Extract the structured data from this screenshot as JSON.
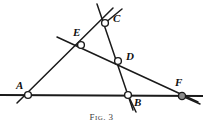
{
  "figure": {
    "caption_lead": "F",
    "caption_small": "IG",
    "caption_sep": ". ",
    "caption_number": "3",
    "caption_full": "FIG. 3",
    "background_color": "#ffffff",
    "ink_color": "#1a1a1a",
    "marker_fill_color": "#ffffff",
    "marker_special_fill_color": "#8a8a8a"
  },
  "points": [
    {
      "id": "A",
      "label": "A",
      "x": 28,
      "y": 95,
      "label_x": 16,
      "label_y": 80,
      "marker": "open-circle"
    },
    {
      "id": "B",
      "label": "B",
      "x": 128,
      "y": 95,
      "label_x": 134,
      "label_y": 98,
      "marker": "open-circle"
    },
    {
      "id": "C",
      "label": "C",
      "x": 105,
      "y": 23,
      "label_x": 113,
      "label_y": 14,
      "marker": "open-circle"
    },
    {
      "id": "D",
      "label": "D",
      "x": 118,
      "y": 61,
      "label_x": 126,
      "label_y": 52,
      "marker": "open-circle"
    },
    {
      "id": "E",
      "label": "E",
      "x": 81,
      "y": 45,
      "label_x": 74,
      "label_y": 28,
      "marker": "open-circle"
    },
    {
      "id": "F",
      "label": "F",
      "x": 182,
      "y": 96,
      "label_x": 176,
      "label_y": 78,
      "marker": "filled-circle"
    }
  ],
  "lines": [
    {
      "id": "baseline-ABF",
      "name": "horizontal-base-line",
      "x1": 0,
      "y1": 95,
      "x2": 203,
      "y2": 96
    },
    {
      "id": "line-A-E-C",
      "name": "line-through-A-E-C",
      "x1": 17,
      "y1": 103,
      "x2": 113,
      "y2": 8
    },
    {
      "id": "line-E-D-F",
      "name": "line-through-E-D-F",
      "x1": 57,
      "y1": 37,
      "x2": 198,
      "y2": 102
    },
    {
      "id": "line-C-D-B",
      "name": "line-through-C-D-B",
      "x1": 97,
      "y1": 4,
      "x2": 133,
      "y2": 110
    }
  ],
  "labels": {
    "diagram_title": "Geometric figure with six labelled points",
    "point_names": [
      "A",
      "B",
      "C",
      "D",
      "E",
      "F"
    ]
  }
}
